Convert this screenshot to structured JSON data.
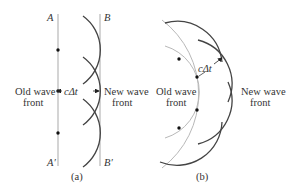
{
  "panel_a": {
    "label_A": "A",
    "label_B": "B",
    "label_A_prime": "A′",
    "label_B_prime": "B′",
    "old_wave_line1": "Old wave",
    "old_wave_line2": "front",
    "new_wave_line1": "New wave",
    "new_wave_line2": "front",
    "distance_label": "cΔt",
    "caption": "(a)"
  },
  "panel_b": {
    "old_wave_line1": "Old wave",
    "old_wave_line2": "front",
    "new_wave_line1": "New wave",
    "new_wave_line2": "front",
    "distance_label": "cΔt",
    "caption": "(b)"
  },
  "colors": {
    "wavefront_line": "#b8b8b8",
    "wavelet_arc": "#444444",
    "dot": "#111111",
    "text": "#333333"
  }
}
